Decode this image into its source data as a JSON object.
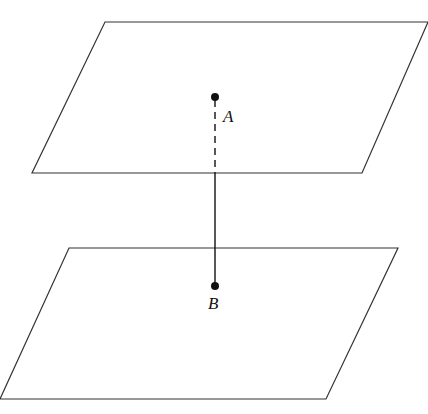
{
  "diagram": {
    "colors": {
      "stroke": "#333333",
      "point": "#111111",
      "background": "#ffffff"
    },
    "planes": [
      {
        "name": "upper-plane",
        "points": "105,22 428,22 362,173 32,173"
      },
      {
        "name": "lower-plane",
        "points": "69,248 398,248 326,399 0,399"
      }
    ],
    "points": {
      "A": {
        "label": "A",
        "x": 215,
        "y": 97,
        "label_x": 223,
        "label_y": 122
      },
      "B": {
        "label": "B",
        "x": 215,
        "y": 286,
        "label_x": 208,
        "label_y": 309
      }
    },
    "segments": {
      "hidden": {
        "x1": 215,
        "y1": 100,
        "x2": 215,
        "y2": 173,
        "style": "dashed"
      },
      "visible": {
        "x1": 215,
        "y1": 173,
        "x2": 215,
        "y2": 286,
        "style": "solid"
      }
    }
  }
}
